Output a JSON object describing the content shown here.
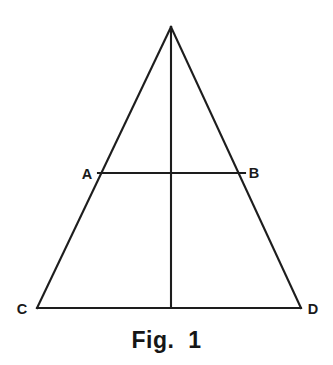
{
  "figure": {
    "caption": "Fig.  1",
    "background_color": "#ffffff",
    "stroke_color": "#1d1d1d",
    "label_color": "#1a1a1a",
    "stroke_width": 2.1,
    "width": 333,
    "height": 365
  },
  "diagram": {
    "type": "geometry-triangle",
    "points": {
      "apex": {
        "x": 171,
        "y": 27
      },
      "A": {
        "x": 98,
        "y": 173
      },
      "B": {
        "x": 245,
        "y": 173
      },
      "C": {
        "x": 37,
        "y": 308
      },
      "D": {
        "x": 301,
        "y": 308
      },
      "foot": {
        "x": 171,
        "y": 308
      }
    },
    "labels": [
      {
        "id": "A",
        "text": "A",
        "x": 87,
        "y": 179,
        "anchor": "middle"
      },
      {
        "id": "B",
        "text": "B",
        "x": 254,
        "y": 178,
        "anchor": "middle"
      },
      {
        "id": "C",
        "text": "C",
        "x": 22,
        "y": 314,
        "anchor": "middle"
      },
      {
        "id": "D",
        "text": "D",
        "x": 313,
        "y": 314,
        "anchor": "middle"
      }
    ],
    "segments": [
      {
        "id": "left-side",
        "name": "apex-to-C",
        "x1": 171,
        "y1": 27,
        "x2": 37,
        "y2": 308
      },
      {
        "id": "right-side",
        "name": "apex-to-D",
        "x1": 171,
        "y1": 27,
        "x2": 301,
        "y2": 308
      },
      {
        "id": "base",
        "name": "C-to-D",
        "x1": 37,
        "y1": 308,
        "x2": 301,
        "y2": 308
      },
      {
        "id": "midsegment",
        "name": "A-to-B",
        "x1": 98,
        "y1": 173,
        "x2": 245,
        "y2": 173
      },
      {
        "id": "altitude",
        "name": "apex-to-base",
        "x1": 171,
        "y1": 27,
        "x2": 171,
        "y2": 308
      }
    ]
  }
}
